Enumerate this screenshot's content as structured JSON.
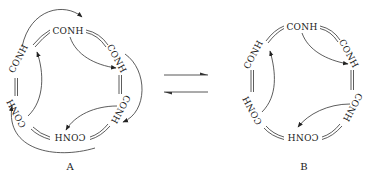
{
  "diagram": {
    "type": "chemical-equilibrium",
    "structure_A": {
      "label": "A",
      "groups": [
        "CONH",
        "CONH",
        "CONH",
        "CONH",
        "CONH",
        "CONH"
      ],
      "description": "Cyclic hexamer of CONH groups linked by double bonds, with three long-range curved arrows (hydrogen bonds) spanning across alternate groups plus three short-range arrows"
    },
    "structure_B": {
      "label": "B",
      "groups": [
        "CONH",
        "CONH",
        "CONH",
        "CONH",
        "CONH",
        "CONH"
      ],
      "description": "Cyclic hexamer of CONH groups linked by double bonds, with three short curved arrows between adjacent groups"
    },
    "equilibrium_arrow": "⇌"
  }
}
